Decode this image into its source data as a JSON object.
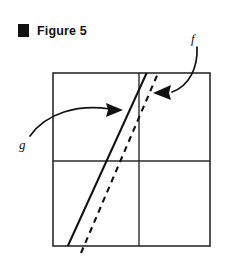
{
  "figure": {
    "bullet_icon": "black-square-bullet",
    "title": "Figure 5"
  },
  "diagram": {
    "frame": {
      "left": 53,
      "top": 73,
      "right": 210,
      "bottom": 246,
      "stroke_color": "#2b2b2b",
      "stroke_width": 1.6
    },
    "dividers": {
      "vertical_x": 139,
      "horizontal_y": 161,
      "stroke_color": "#2b2b2b",
      "stroke_width": 1.4
    },
    "curves": [
      {
        "name": "g",
        "style": "solid",
        "label": "g",
        "label_x": 19,
        "label_y": 148,
        "x1": 68,
        "y1": 246,
        "x2": 147,
        "y2": 73,
        "stroke_color": "#111111",
        "stroke_width": 2.1
      },
      {
        "name": "f",
        "style": "dashed",
        "label": "f",
        "label_x": 192,
        "label_y": 41,
        "x1": 82,
        "y1": 251,
        "x2": 158,
        "y2": 73,
        "stroke_color": "#111111",
        "stroke_width": 2.1,
        "dash_pattern": "6 5"
      }
    ],
    "annotations": [
      {
        "name": "g-pointer",
        "for_label": "g",
        "path": "M 30 135 C 48 112 80 104 113 109",
        "arrow_tip_x": 122,
        "arrow_tip_y": 110,
        "direction": "right"
      },
      {
        "name": "f-pointer",
        "for_label": "f",
        "path": "M 196 48 C 196 70 186 88 170 92",
        "arrow_tip_x": 154,
        "arrow_tip_y": 93,
        "direction": "left"
      }
    ],
    "background_color": "#ffffff"
  }
}
